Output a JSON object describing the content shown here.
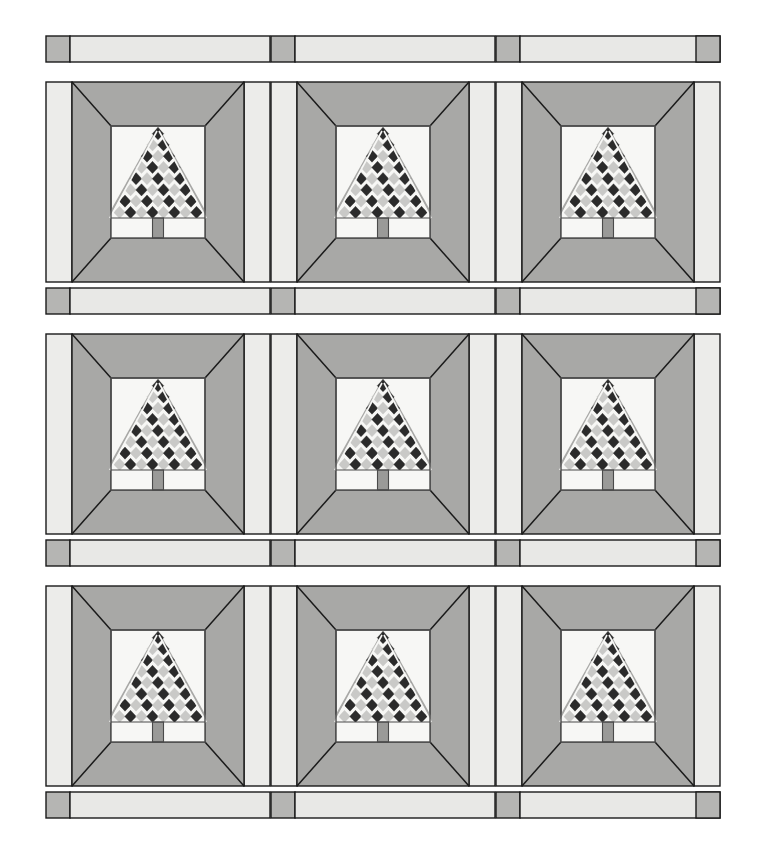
{
  "artwork": {
    "title": "Christmas Tree Quilt Layout",
    "type": "quilt-pattern-diagram",
    "canvas": {
      "width": 766,
      "height": 848,
      "background": "#ffffff"
    }
  },
  "palette": {
    "background": "#ffffff",
    "sashing_light": "#e8e8e6",
    "cornerstone_gray": "#b5b5b3",
    "block_frame_gray": "#a8a8a6",
    "block_strip_light": "#ececea",
    "tree_dark": "#2b2b2b",
    "tree_light": "#c9c9c7",
    "center_white": "#f7f7f5",
    "trunk_gray": "#9a9a98",
    "outline": "#1a1a1a",
    "outline_soft": "#4a4a4a"
  },
  "layout": {
    "rows": 3,
    "columns": 3,
    "total_blocks": 9,
    "sashing_rows": 4,
    "sashing_strips_per_row": 3,
    "cornerstones_per_sashing_row": 4,
    "grid_origin": {
      "x": 46,
      "y": 36
    },
    "grid_width": 674,
    "block_width": 224,
    "block_height": 200,
    "sashing_height": 26,
    "cornerstone_width": 24
  },
  "block": {
    "name": "framed-checkerboard-tree",
    "side_strip_width": 26,
    "frame_inset": 0,
    "center_inset_x": 68,
    "center_inset_y": 44,
    "center_width": 94,
    "center_height": 112,
    "description": "Light vertical strips flank a gray mitered frame enclosing a white center square with a checkerboard diamond tree over a trunk row."
  },
  "tree": {
    "rows": 8,
    "diamond_size": 11,
    "apex_offset_y": 2,
    "trunk": {
      "width": 11,
      "height": 20,
      "color": "#9a9a98"
    },
    "trunk_row_height": 20,
    "checker_pattern": "alternating dark and light diamonds",
    "colors": {
      "dark": "#2b2b2b",
      "light": "#c9c9c7"
    }
  },
  "sashing_rows": [
    {
      "index": 0,
      "y": 36,
      "label": "top-sashing"
    },
    {
      "index": 1,
      "y": 288,
      "label": "upper-middle-sashing"
    },
    {
      "index": 2,
      "y": 540,
      "label": "lower-middle-sashing"
    },
    {
      "index": 3,
      "y": 792,
      "label": "bottom-sashing"
    }
  ],
  "block_rows": [
    {
      "index": 0,
      "y": 82,
      "label": "block-row-1"
    },
    {
      "index": 1,
      "y": 334,
      "label": "block-row-2"
    },
    {
      "index": 2,
      "y": 586,
      "label": "block-row-3"
    }
  ],
  "block_columns": [
    {
      "index": 0,
      "x": 46,
      "label": "block-column-1"
    },
    {
      "index": 1,
      "x": 271,
      "label": "block-column-2"
    },
    {
      "index": 2,
      "x": 496,
      "label": "block-column-3"
    }
  ],
  "chart_data": {
    "type": "table",
    "categories": [
      "Column 1",
      "Column 2",
      "Column 3"
    ],
    "rows": [
      "Row 1",
      "Row 2",
      "Row 3"
    ],
    "values": [
      [
        1,
        1,
        1
      ],
      [
        1,
        1,
        1
      ],
      [
        1,
        1,
        1
      ]
    ],
    "xlabel": "Block column",
    "ylabel": "Block row",
    "grid": true,
    "legend": [
      "Tree block",
      "Sashing strip",
      "Cornerstone"
    ]
  }
}
